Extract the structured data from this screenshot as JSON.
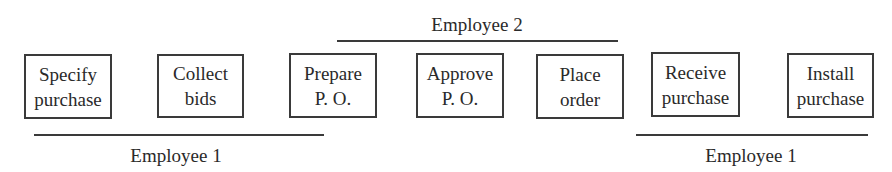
{
  "diagram": {
    "type": "process-flow",
    "steps": [
      {
        "id": 1,
        "line1": "Specify",
        "line2": "purchase"
      },
      {
        "id": 2,
        "line1": "Collect",
        "line2": "bids"
      },
      {
        "id": 3,
        "line1": "Prepare",
        "line2": "P. O."
      },
      {
        "id": 4,
        "line1": "Approve",
        "line2": "P. O."
      },
      {
        "id": 5,
        "line1": "Place",
        "line2": "order"
      },
      {
        "id": 6,
        "line1": "Receive",
        "line2": "purchase"
      },
      {
        "id": 7,
        "line1": "Install",
        "line2": "purchase"
      }
    ],
    "groups": [
      {
        "label": "Employee 1",
        "position": "below",
        "covers_steps": [
          1,
          2,
          3
        ]
      },
      {
        "label": "Employee 2",
        "position": "above",
        "covers_steps": [
          3,
          4,
          5
        ]
      },
      {
        "label": "Employee 1",
        "position": "below",
        "covers_steps": [
          6,
          7
        ]
      }
    ]
  }
}
